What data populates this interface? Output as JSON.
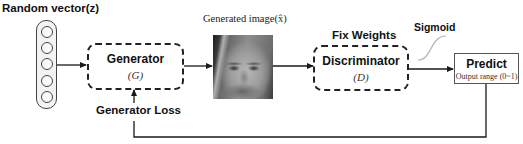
{
  "diagram": {
    "random_vector": {
      "label": "Random vector(z)",
      "node_count": 5
    },
    "generator": {
      "title": "Generator",
      "symbol": "(G)"
    },
    "generator_loss": {
      "label": "Generator Loss"
    },
    "generated_image": {
      "label": "Generated image(x̂)",
      "content": "grayscale generated face"
    },
    "fix_weights": {
      "label": "Fix Weights"
    },
    "discriminator": {
      "title": "Discriminator",
      "symbol": "(D)"
    },
    "sigmoid": {
      "label": "Sigmoid",
      "icon": "sigmoid-curve-icon"
    },
    "predict": {
      "title": "Predict",
      "subtitle": "Output range (0~1)"
    },
    "colors": {
      "line": "#1a1a1a",
      "box_border": "#222222",
      "sigmoid_curve": "#b5b5b5",
      "background": "#ffffff"
    }
  }
}
